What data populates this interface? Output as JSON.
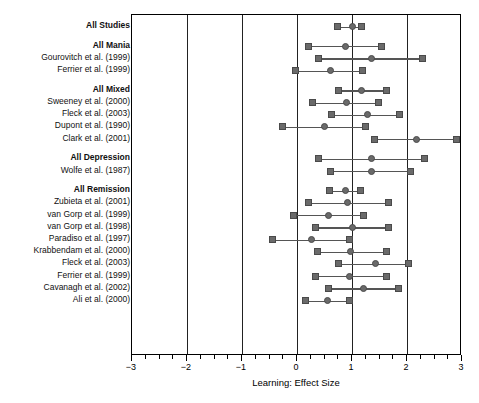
{
  "chart_data": {
    "type": "scatter",
    "title": "",
    "xlabel": "Learning: Effect Size",
    "ylabel": "",
    "xlim": [
      -3,
      3
    ],
    "xticks": [
      -3,
      -2,
      -1,
      0,
      1,
      2,
      3
    ],
    "xticklabels": [
      "−3",
      "−2",
      "−1",
      "0",
      "1",
      "2",
      "3"
    ],
    "minor_tick_step": 0.25,
    "grid": "vertical gridlines at -2, -1, 0, 1, 2",
    "gridlines": [
      -2,
      -1,
      0,
      1,
      2
    ],
    "legend": "none",
    "marker_color": "#6a6a6a",
    "line_color": "#555555",
    "rows": [
      {
        "label": "All Studies",
        "group": true,
        "spacer_after": true,
        "estimate": 1.01,
        "ci_low": 0.73,
        "ci_high": 1.17
      },
      {
        "label": "All Mania",
        "group": true,
        "estimate": 0.88,
        "ci_low": 0.2,
        "ci_high": 1.54
      },
      {
        "label": "Gourovitch et al. (1999)",
        "group": false,
        "estimate": 1.36,
        "ci_low": 0.39,
        "ci_high": 2.29
      },
      {
        "label": "Ferrier et al. (1999)",
        "group": false,
        "spacer_after": true,
        "estimate": 0.6,
        "ci_low": -0.02,
        "ci_high": 1.19
      },
      {
        "label": "All Mixed",
        "group": true,
        "estimate": 1.17,
        "ci_low": 0.75,
        "ci_high": 1.63
      },
      {
        "label": "Sweeney et al. (2000)",
        "group": false,
        "estimate": 0.9,
        "ci_low": 0.28,
        "ci_high": 1.48
      },
      {
        "label": "Fleck et al. (2003)",
        "group": false,
        "estimate": 1.28,
        "ci_low": 0.62,
        "ci_high": 1.87
      },
      {
        "label": "Dupont et al. (1990)",
        "group": false,
        "estimate": 0.5,
        "ci_low": -0.26,
        "ci_high": 1.25
      },
      {
        "label": "Clark et al. (2001)",
        "group": false,
        "spacer_after": true,
        "estimate": 2.17,
        "ci_low": 1.4,
        "ci_high": 2.9
      },
      {
        "label": "All Depression",
        "group": true,
        "estimate": 1.36,
        "ci_low": 0.39,
        "ci_high": 2.31
      },
      {
        "label": "Wolfe et al. (1987)",
        "group": false,
        "spacer_after": true,
        "estimate": 1.36,
        "ci_low": 0.6,
        "ci_high": 2.07
      },
      {
        "label": "All Remission",
        "group": true,
        "estimate": 0.88,
        "ci_low": 0.59,
        "ci_high": 1.16
      },
      {
        "label": "Zubieta et al. (2001)",
        "group": false,
        "estimate": 0.92,
        "ci_low": 0.2,
        "ci_high": 1.67
      },
      {
        "label": "van Gorp et al. (1999)",
        "group": false,
        "estimate": 0.57,
        "ci_low": -0.07,
        "ci_high": 1.21
      },
      {
        "label": "van Gorp et al. (1998)",
        "group": false,
        "estimate": 1.01,
        "ci_low": 0.33,
        "ci_high": 1.67
      },
      {
        "label": "Paradiso et al. (1997)",
        "group": false,
        "estimate": 0.26,
        "ci_low": -0.44,
        "ci_high": 0.96
      },
      {
        "label": "Krabbendam et al. (2000)",
        "group": false,
        "estimate": 0.97,
        "ci_low": 0.37,
        "ci_high": 1.63
      },
      {
        "label": "Fleck et al. (2003)",
        "group": false,
        "estimate": 1.42,
        "ci_low": 0.75,
        "ci_high": 2.02
      },
      {
        "label": "Ferrier et al. (1999)",
        "group": false,
        "estimate": 0.96,
        "ci_low": 0.33,
        "ci_high": 1.63
      },
      {
        "label": "Cavanagh et al. (2002)",
        "group": false,
        "estimate": 1.21,
        "ci_low": 0.57,
        "ci_high": 1.84
      },
      {
        "label": "Ali et al. (2000)",
        "group": false,
        "estimate": 0.55,
        "ci_low": 0.15,
        "ci_high": 0.96
      }
    ]
  },
  "axis": {
    "title": "Learning: Effect Size"
  }
}
